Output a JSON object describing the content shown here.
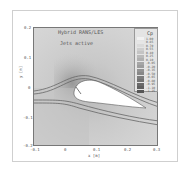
{
  "chart_data": {
    "type": "heatmap",
    "title": "Hybrid RANS/LES",
    "subtitle": "Jets active",
    "xlabel": "x [m]",
    "ylabel": "y [m]",
    "xlim": [
      -0.1,
      0.3
    ],
    "ylim": [
      -0.2,
      0.2
    ],
    "x_ticks": [
      "-0.1",
      "0",
      "0.1",
      "0.2",
      "0.3"
    ],
    "y_ticks": [
      "0.2",
      "0.1",
      "0",
      "-0.1",
      "-0.2"
    ],
    "legend": {
      "title": "Cp",
      "position": "upper right inside",
      "levels": [
        "1.00",
        "0.85",
        "0.70",
        "0.55",
        "0.40",
        "0.25",
        "0.10",
        "-0.05",
        "-0.20",
        "-0.35",
        "-0.50",
        "-0.65",
        "-0.80",
        "-0.95",
        "-1.10",
        "-1.25"
      ],
      "colors": [
        "#f2f2f2",
        "#e6e6e6",
        "#dadada",
        "#cecece",
        "#c4c4c4",
        "#bababa",
        "#b0b0b0",
        "#a6a6a6",
        "#9c9c9c",
        "#929292",
        "#888888",
        "#7e7e7e",
        "#747474",
        "#6a6a6a",
        "#606060",
        "#555555"
      ]
    },
    "annotations": [
      "airfoil profile (white)",
      "streamlines over airfoil"
    ],
    "grid": false
  }
}
